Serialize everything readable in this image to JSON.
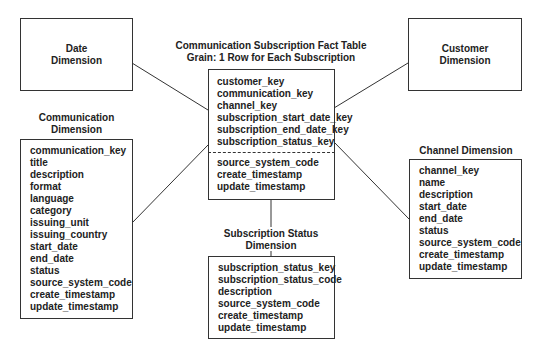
{
  "date_dimension": {
    "line1": "Date",
    "line2": "Dimension"
  },
  "customer_dimension": {
    "line1": "Customer",
    "line2": "Dimension"
  },
  "fact_table": {
    "title_line1": "Communication Subscription Fact Table",
    "title_line2": "Grain: 1 Row for Each Subscription",
    "keys": [
      "customer_key",
      "communication_key",
      "channel_key",
      "subscription_start_date_key",
      "subscription_end_date_key",
      "subscription_status_key"
    ],
    "attributes": [
      "source_system_code",
      "create_timestamp",
      "update_timestamp"
    ]
  },
  "communication_dimension": {
    "title_line1": "Communication",
    "title_line2": "Dimension",
    "fields": [
      "communication_key",
      "title",
      "description",
      "format",
      "language",
      "category",
      "issuing_unit",
      "issuing_country",
      "start_date",
      "end_date",
      "status",
      "source_system_code",
      "create_timestamp",
      "update_timestamp"
    ]
  },
  "subscription_status_dimension": {
    "title_line1": "Subscription Status",
    "title_line2": "Dimension",
    "fields": [
      "subscription_status_key",
      "subscription_status_code",
      "description",
      "source_system_code",
      "create_timestamp",
      "update_timestamp"
    ]
  },
  "channel_dimension": {
    "title": "Channel Dimension",
    "fields": [
      "channel_key",
      "name",
      "description",
      "start_date",
      "end_date",
      "status",
      "source_system_code",
      "create_timestamp",
      "update_timestamp"
    ]
  },
  "colors": {
    "line": "#333333",
    "text": "#222222",
    "background": "#ffffff"
  }
}
